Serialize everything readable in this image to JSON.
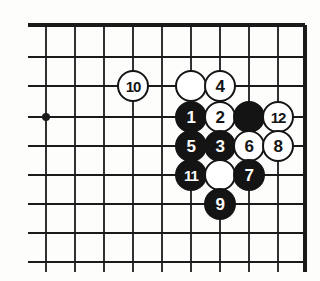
{
  "figure": {
    "kind": "go-board-diagram",
    "caption": "",
    "background_color": "#fdfdfc",
    "line_color": "#1a1a1a",
    "black_stone_color": "#141414",
    "white_stone_color": "#ffffff"
  },
  "board": {
    "edges": {
      "top_border": true,
      "right_border": true,
      "left_open": true,
      "bottom_open": true
    },
    "spacing_px": 29,
    "vertical_lines_x": [
      46,
      75,
      104,
      133,
      162,
      191,
      220,
      249,
      278,
      305
    ],
    "horizontal_lines_y": [
      25,
      57,
      86,
      117,
      146,
      175,
      204,
      233,
      262
    ],
    "star_points": [
      {
        "name": "hoshi",
        "x": 46,
        "y": 117
      }
    ]
  },
  "stones": [
    {
      "id": "stone-10",
      "color": "white",
      "label": "10",
      "x": 133,
      "y": 86
    },
    {
      "id": "stone-white-unnumbered-a",
      "color": "white",
      "label": "",
      "x": 191,
      "y": 86
    },
    {
      "id": "stone-4",
      "color": "white",
      "label": "4",
      "x": 220,
      "y": 86
    },
    {
      "id": "stone-1",
      "color": "black",
      "label": "1",
      "x": 191,
      "y": 117
    },
    {
      "id": "stone-2",
      "color": "white",
      "label": "2",
      "x": 220,
      "y": 117
    },
    {
      "id": "stone-black-unnumbered-a",
      "color": "black",
      "label": "",
      "x": 249,
      "y": 117
    },
    {
      "id": "stone-12",
      "color": "white",
      "label": "12",
      "x": 278,
      "y": 117
    },
    {
      "id": "stone-5",
      "color": "black",
      "label": "5",
      "x": 191,
      "y": 146
    },
    {
      "id": "stone-3",
      "color": "black",
      "label": "3",
      "x": 220,
      "y": 146
    },
    {
      "id": "stone-6",
      "color": "white",
      "label": "6",
      "x": 249,
      "y": 146
    },
    {
      "id": "stone-8",
      "color": "white",
      "label": "8",
      "x": 278,
      "y": 146
    },
    {
      "id": "stone-11",
      "color": "black",
      "label": "11",
      "x": 191,
      "y": 175
    },
    {
      "id": "stone-white-unnumbered-b",
      "color": "white",
      "label": "",
      "x": 220,
      "y": 175
    },
    {
      "id": "stone-7",
      "color": "black",
      "label": "7",
      "x": 249,
      "y": 175
    },
    {
      "id": "stone-9",
      "color": "black",
      "label": "9",
      "x": 220,
      "y": 204
    }
  ]
}
